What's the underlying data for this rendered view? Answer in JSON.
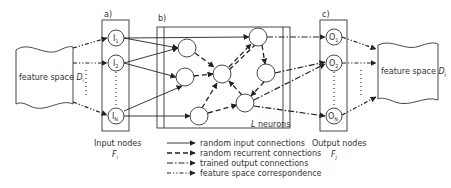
{
  "panels": {
    "a": {
      "label": "a)",
      "caption_line1": "Input nodes",
      "caption_line2": "F",
      "caption_sub": "i",
      "nodes": [
        {
          "name": "I",
          "sub": "1"
        },
        {
          "name": "I",
          "sub": "2"
        },
        {
          "name": "I",
          "sub": "N"
        }
      ]
    },
    "b": {
      "label": "b)",
      "caption": "L neurons",
      "caption_italic": "L",
      "caption_rest": " neurons"
    },
    "c": {
      "label": "c)",
      "caption_line1": "Output nodes",
      "caption_line2": "F",
      "caption_sub": "j",
      "nodes": [
        {
          "name": "O",
          "sub": "1"
        },
        {
          "name": "O",
          "sub": "2"
        },
        {
          "name": "O",
          "sub": "N"
        }
      ]
    }
  },
  "feature_left": {
    "text": "feature space ",
    "var": "D",
    "sub": "i"
  },
  "feature_right": {
    "text": "feature space ",
    "var": "D",
    "sub": "j"
  },
  "legend": [
    {
      "style": "solid",
      "label": "random input connections"
    },
    {
      "style": "dashed",
      "label": "random recurrent connections"
    },
    {
      "style": "dash-dot",
      "label": "trained output connections"
    },
    {
      "style": "dash-dot-dot",
      "label": "feature space correspondence"
    }
  ]
}
